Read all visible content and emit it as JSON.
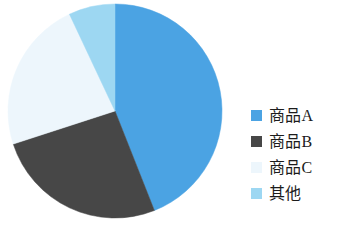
{
  "chart_data": {
    "type": "pie",
    "title": "",
    "subtitle": "",
    "xlabel": "",
    "ylabel": "",
    "grid": false,
    "legend_position": "right",
    "start_angle_deg": 0,
    "direction": "clockwise",
    "categories": [
      "商品A",
      "商品B",
      "商品C",
      "其他"
    ],
    "values": [
      44,
      26,
      23,
      7
    ],
    "unit": "%",
    "slices": [
      {
        "label": "商品A",
        "value": 44,
        "color": "#4BA3E3",
        "start_angle_deg": 0,
        "end_angle_deg": 158.4
      },
      {
        "label": "商品B",
        "value": 26,
        "color": "#474747",
        "start_angle_deg": 158.4,
        "end_angle_deg": 252.0
      },
      {
        "label": "商品C",
        "value": 23,
        "color": "#EDF6FC",
        "start_angle_deg": 252.0,
        "end_angle_deg": 334.8
      },
      {
        "label": "其他",
        "value": 7,
        "color": "#9DD7F2",
        "start_angle_deg": 334.8,
        "end_angle_deg": 360.0
      }
    ]
  },
  "legend": {
    "items": [
      {
        "label": "商品A",
        "color": "#4BA3E3"
      },
      {
        "label": "商品B",
        "color": "#474747"
      },
      {
        "label": "商品C",
        "color": "#EDF6FC"
      },
      {
        "label": "其他",
        "color": "#9DD7F2"
      }
    ]
  },
  "geometry": {
    "center_x": 115,
    "center_y": 111,
    "radius": 107
  },
  "colors": {
    "background": "#FFFFFF",
    "text": "#1C1C1C"
  }
}
